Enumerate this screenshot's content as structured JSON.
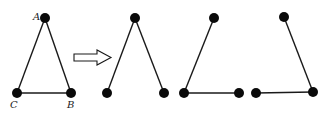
{
  "diagram": {
    "colors": {
      "stroke": "#1a1a1a",
      "vertex": "#0a0a0a",
      "background": "#ffffff"
    },
    "triangle": {
      "vertices": {
        "A": {
          "label": "A",
          "x": 45,
          "y": 18
        },
        "B": {
          "label": "B",
          "x": 71,
          "y": 93
        },
        "C": {
          "label": "C",
          "x": 17,
          "y": 93
        }
      },
      "edges": [
        [
          "A",
          "B"
        ],
        [
          "A",
          "C"
        ],
        [
          "C",
          "B"
        ]
      ]
    },
    "arrow": {
      "symbol": "hollow-right-arrow",
      "from_x": 73,
      "to_x": 112,
      "y": 57
    },
    "paths": [
      {
        "name": "path-1",
        "edges": [
          "left",
          "right"
        ],
        "top": [
          135,
          18
        ],
        "left": [
          107,
          93
        ],
        "right": [
          164,
          93
        ]
      },
      {
        "name": "path-2",
        "edges": [
          "left",
          "bottom"
        ],
        "top": [
          214,
          18
        ],
        "left": [
          184,
          93
        ],
        "right": [
          239,
          93
        ]
      },
      {
        "name": "path-3",
        "edges": [
          "bottom",
          "right"
        ],
        "top": [
          284,
          17
        ],
        "left": [
          256,
          93
        ],
        "right": [
          313,
          92
        ]
      }
    ]
  }
}
